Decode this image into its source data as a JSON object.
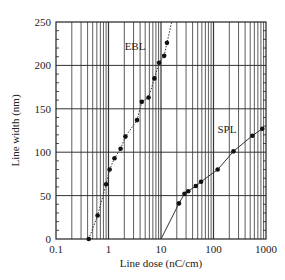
{
  "chart_data": {
    "type": "line",
    "title": "",
    "xlabel": "Line dose (nC/cm)",
    "ylabel": "Line width (nm)",
    "xscale": "log",
    "xlim": [
      0.1,
      1000
    ],
    "ylim": [
      0,
      250
    ],
    "x_ticks": [
      "0.1",
      "1",
      "10",
      "100",
      "1000"
    ],
    "y_ticks": [
      "0",
      "50",
      "100",
      "150",
      "200",
      "250"
    ],
    "grid": true,
    "legend": "inline labels",
    "series": [
      {
        "name": "EBL",
        "line_style": "dotted",
        "marker": "filled-circle",
        "x": [
          0.42,
          0.62,
          0.9,
          1.05,
          1.3,
          1.7,
          2.1,
          3.5,
          4.3,
          5.8,
          7.5,
          9.2,
          11.5,
          13
        ],
        "y": [
          0,
          27,
          63,
          80,
          93,
          104,
          118,
          137,
          158,
          163,
          185,
          203,
          211,
          226
        ],
        "line_extends_to": [
          16,
          250
        ],
        "label_position": [
          3.2,
          218
        ]
      },
      {
        "name": "SPL",
        "line_style": "solid",
        "marker": "filled-circle",
        "line_starts_at": [
          10,
          0
        ],
        "x": [
          22,
          28,
          33,
          46,
          58,
          120,
          240,
          550,
          850
        ],
        "y": [
          41,
          52,
          55,
          61,
          66,
          80,
          101,
          119,
          127
        ],
        "label_position": [
          180,
          122
        ]
      }
    ]
  },
  "plot": {
    "left": 56,
    "right": 266,
    "top": 22,
    "bottom": 239,
    "colors": {
      "grid": "#333333",
      "frame": "#222222",
      "marker": "#111111",
      "line": "#333333"
    }
  }
}
